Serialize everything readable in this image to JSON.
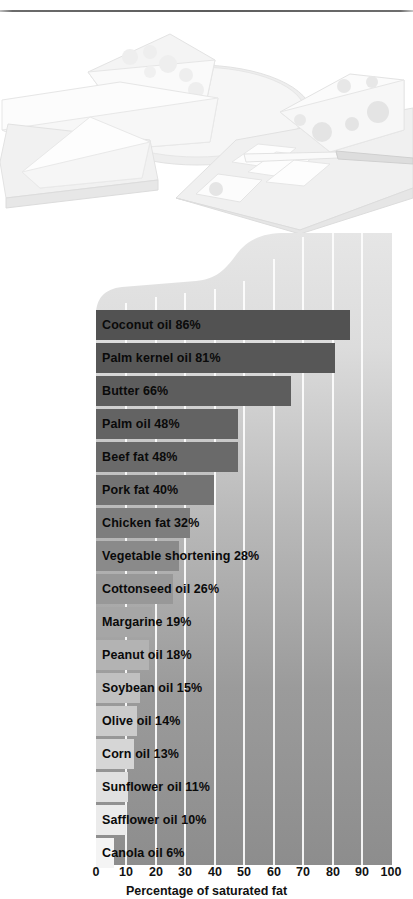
{
  "illustration": {
    "name": "dairy-fats-illustration",
    "description": "Faded line illustration of cheese wedges on a plate, a block of Swiss cheese and butter slices on a cutting board with a knife"
  },
  "chart_data": {
    "type": "bar",
    "orientation": "horizontal",
    "title": "",
    "xlabel": "Percentage of saturated fat",
    "ylabel": "",
    "xlim": [
      0,
      100
    ],
    "xticks": [
      "0",
      "10",
      "20",
      "30",
      "40",
      "50",
      "60",
      "70",
      "80",
      "90",
      "100"
    ],
    "grid": "vertical-white-gridlines",
    "legend": "none",
    "categories": [
      "Coconut oil",
      "Palm kernel oil",
      "Butter",
      "Palm oil",
      "Beef fat",
      "Pork fat",
      "Chicken fat",
      "Vegetable shortening",
      "Cottonseed oil",
      "Margarine",
      "Peanut oil",
      "Soybean oil",
      "Olive oil",
      "Corn oil",
      "Sunflower oil",
      "Safflower oil",
      "Canola oil"
    ],
    "values": [
      86,
      81,
      66,
      48,
      48,
      40,
      32,
      28,
      26,
      19,
      18,
      15,
      14,
      13,
      11,
      10,
      6
    ],
    "bars": [
      {
        "label": "Coconut oil  86%",
        "name": "coconut-oil",
        "value": 86,
        "color": "#525252"
      },
      {
        "label": "Palm kernel oil  81%",
        "name": "palm-kernel-oil",
        "value": 81,
        "color": "#575757"
      },
      {
        "label": "Butter  66%",
        "name": "butter",
        "value": 66,
        "color": "#5d5d5d"
      },
      {
        "label": "Palm oil  48%",
        "name": "palm-oil",
        "value": 48,
        "color": "#636363"
      },
      {
        "label": "Beef fat  48%",
        "name": "beef-fat",
        "value": 48,
        "color": "#6a6a6a"
      },
      {
        "label": "Pork fat  40%",
        "name": "pork-fat",
        "value": 40,
        "color": "#737373"
      },
      {
        "label": "Chicken fat  32%",
        "name": "chicken-fat",
        "value": 32,
        "color": "#7e7e7e"
      },
      {
        "label": "Vegetable shortening  28%",
        "name": "vegetable-shortening",
        "value": 28,
        "color": "#8a8a8a"
      },
      {
        "label": "Cottonseed oil  26%",
        "name": "cottonseed-oil",
        "value": 26,
        "color": "#989898"
      },
      {
        "label": "Margarine  19%",
        "name": "margarine",
        "value": 19,
        "color": "#a6a6a6"
      },
      {
        "label": "Peanut oil  18%",
        "name": "peanut-oil",
        "value": 18,
        "color": "#b3b3b3"
      },
      {
        "label": "Soybean oil 15%",
        "name": "soybean-oil",
        "value": 15,
        "color": "#c0c0c0"
      },
      {
        "label": "Olive oil  14%",
        "name": "olive-oil",
        "value": 14,
        "color": "#cbcbcb"
      },
      {
        "label": "Corn oil  13%",
        "name": "corn-oil",
        "value": 13,
        "color": "#d6d6d6"
      },
      {
        "label": "Sunflower oil  11%",
        "name": "sunflower-oil",
        "value": 11,
        "color": "#e0e0e0"
      },
      {
        "label": "Safflower oil  10%",
        "name": "safflower-oil",
        "value": 10,
        "color": "#ebebeb"
      },
      {
        "label": "Canola oil  6%",
        "name": "canola-oil",
        "value": 6,
        "color": "#f4f4f4"
      }
    ]
  },
  "colors": {
    "plot_background_top": "#e3e3e3",
    "plot_background_bottom": "#8d8d8d",
    "gridline": "#fdfdfd",
    "text": "#111111",
    "top_rule": "#5c5c5c"
  }
}
